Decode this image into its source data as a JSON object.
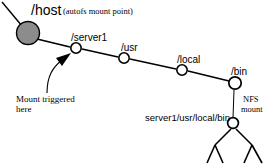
{
  "diagram": {
    "colors": {
      "stroke": "#000000",
      "root_node_fill": "#8c8c8c",
      "node_fill": "#ffffff",
      "background": "#ffffff"
    },
    "root": {
      "label": "/host",
      "annotation": "(autofs mount point)",
      "shape": "filled-circle"
    },
    "path_nodes": [
      {
        "label": "/server1",
        "shape": "open-circle"
      },
      {
        "label": "/usr",
        "shape": "open-circle"
      },
      {
        "label": "/local",
        "shape": "open-circle"
      },
      {
        "label": "/bin",
        "shape": "open-circle"
      }
    ],
    "callout": {
      "text_line1": "Mount triggered",
      "text_line2": "here",
      "points_to": "/server1"
    },
    "nfs_link": {
      "label_line1": "NFS",
      "label_line2": "mount",
      "target_label": "server1/usr/local/bin",
      "target_shape": "open-circle"
    }
  }
}
